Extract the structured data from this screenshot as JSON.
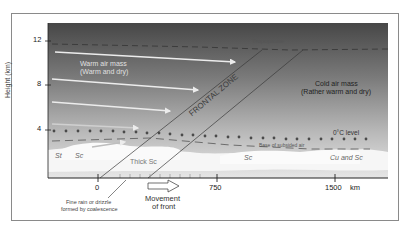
{
  "diagram": {
    "y_axis": {
      "label": "Height (km)",
      "ticks": [
        "12",
        "8",
        "4"
      ]
    },
    "x_axis": {
      "ticks": [
        "0",
        "750",
        "1500"
      ],
      "unit": "km"
    },
    "labels": {
      "tropopause": "Tropopause",
      "warm_air_line1": "Warm air mass",
      "warm_air_line2": "(Warm and dry)",
      "cold_air_line1": "Cold air mass",
      "cold_air_line2": "(Rather warm and dry)",
      "frontal_zone": "FRONTAL ZONE",
      "freezing_level": "0°C level",
      "subsided_air": "Base of subsided air",
      "cloud_st": "St",
      "cloud_sc_left": "Sc",
      "cloud_thick_sc": "Thick Sc",
      "cloud_sc_mid": "Sc",
      "cloud_cu_sc": "Cu and Sc",
      "drizzle_line1": "Fine rain or drizzle",
      "drizzle_line2": "formed by coalescence",
      "movement_line1": "Movement",
      "movement_line2": "of front"
    },
    "colors": {
      "sky_top": "#4a4a4a",
      "sky_bottom": "#e4e4e4",
      "cloud": "#f7f7f7",
      "arrow": "#e8e8e8",
      "lines": "#3a3a3a"
    }
  }
}
